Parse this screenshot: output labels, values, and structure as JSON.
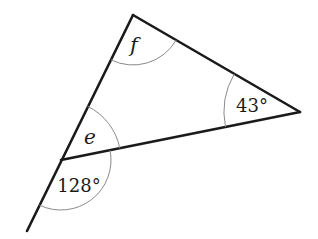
{
  "diagram": {
    "type": "triangle-angles",
    "vertices": {
      "top": [
        133,
        15
      ],
      "right": [
        300,
        112
      ],
      "left": [
        61,
        160
      ],
      "extension_end": [
        27,
        231
      ]
    },
    "labels": {
      "f": "f",
      "e": "e",
      "angle_right": "43°",
      "angle_exterior": "128°"
    },
    "colors": {
      "line": "#1a1a1a",
      "arc": "#8a8a8a",
      "background": "#ffffff"
    }
  }
}
